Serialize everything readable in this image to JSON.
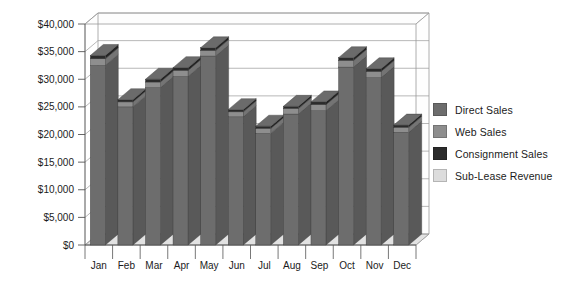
{
  "chart_data": {
    "type": "bar",
    "title": "",
    "subtitle": "",
    "xlabel": "",
    "ylabel": "",
    "categories": [
      "Jan",
      "Feb",
      "Mar",
      "Apr",
      "May",
      "Jun",
      "Jul",
      "Aug",
      "Sep",
      "Oct",
      "Nov",
      "Dec"
    ],
    "ylim": [
      0,
      40000
    ],
    "ytick_values": [
      0,
      5000,
      10000,
      15000,
      20000,
      25000,
      30000,
      35000,
      40000
    ],
    "ytick_labels": [
      "$0",
      "$5,000",
      "$10,000",
      "$15,000",
      "$20,000",
      "$25,000",
      "$30,000",
      "$35,000",
      "$40,000"
    ],
    "grid": true,
    "grid_axis": "y",
    "legend_position": "right",
    "stacked": true,
    "three_d": true,
    "series": [
      {
        "name": "Direct Sales",
        "color": "#6d6d6d",
        "values": [
          32500,
          25000,
          28500,
          30500,
          34200,
          23200,
          20200,
          23700,
          24300,
          32200,
          30300,
          20400
        ]
      },
      {
        "name": "Web Sales",
        "color": "#8e8e8e",
        "values": [
          1200,
          900,
          1000,
          1100,
          1000,
          900,
          900,
          1000,
          1100,
          1200,
          1100,
          900
        ]
      },
      {
        "name": "Consignment Sales",
        "color": "#2b2b2b",
        "values": [
          600,
          400,
          500,
          500,
          500,
          400,
          400,
          400,
          500,
          500,
          500,
          400
        ]
      },
      {
        "name": "Sub-Lease Revenue",
        "color": "#dcdcdc",
        "values": [
          0,
          0,
          0,
          0,
          0,
          0,
          0,
          0,
          0,
          0,
          0,
          0
        ]
      }
    ],
    "totals": [
      34300,
      26300,
      30000,
      32100,
      35700,
      24500,
      21500,
      25100,
      25900,
      33900,
      31900,
      21700
    ]
  },
  "legend": {
    "items": [
      {
        "label": "Direct Sales",
        "color": "#6d6d6d"
      },
      {
        "label": "Web Sales",
        "color": "#8e8e8e"
      },
      {
        "label": "Consignment Sales",
        "color": "#2b2b2b"
      },
      {
        "label": "Sub-Lease Revenue",
        "color": "#dcdcdc"
      }
    ]
  },
  "axes": {
    "y_labels": [
      "$40,000",
      "$35,000",
      "$30,000",
      "$25,000",
      "$20,000",
      "$15,000",
      "$10,000",
      "$5,000",
      "$0"
    ],
    "x_labels": [
      "Jan",
      "Feb",
      "Mar",
      "Apr",
      "May",
      "Jun",
      "Jul",
      "Aug",
      "Sep",
      "Oct",
      "Nov",
      "Dec"
    ]
  },
  "colors": {
    "plot_background": "#ffffff",
    "grid_line": "#9a9a9a",
    "axis_line": "#555555",
    "floor": "#e2e2e2",
    "text": "#1b1b1b"
  }
}
